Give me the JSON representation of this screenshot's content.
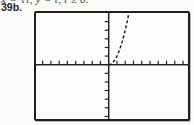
{
  "header": {
    "equation": "x = √t, y = t, t ≥ 0.",
    "figure_label": "39b."
  },
  "colors": {
    "ink": "#1c1c1c",
    "axis": "#262626",
    "curve": "#161616",
    "paper": "#fbfbf9",
    "screen_bg": "#fdfdfc"
  },
  "chart_data": {
    "type": "line",
    "title": "",
    "xlabel": "",
    "ylabel": "",
    "figure_label": "39b.",
    "equation_label": "x = √t, y = t, t ≥ 0.",
    "xlim": [
      -8.8,
      9.6
    ],
    "ylim": [
      -6.3,
      6.0
    ],
    "tick_step": 1,
    "grid": false,
    "legend": "none",
    "axis_style": "cross-at-origin with unlabeled tick marks; x-axis ticks point up, y-axis ticks point left",
    "curve_style": "dashed",
    "series": [
      {
        "name": "x=√t, y=t (y=x², x≥0)",
        "x": [
          0,
          0.25,
          0.5,
          0.75,
          1.0,
          1.25,
          1.5,
          1.75,
          2.0,
          2.2,
          2.45
        ],
        "y": [
          0,
          0.06,
          0.25,
          0.56,
          1.0,
          1.56,
          2.25,
          3.06,
          4.0,
          4.84,
          6.0
        ]
      }
    ]
  }
}
